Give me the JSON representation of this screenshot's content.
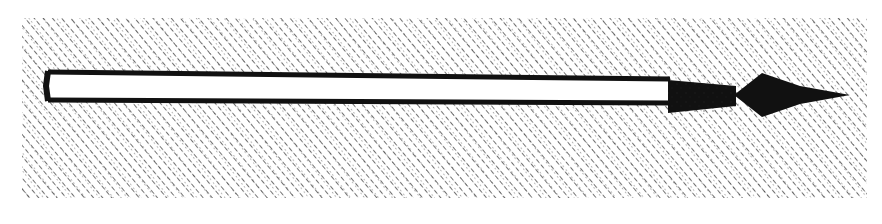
{
  "image": {
    "subject": "engraved illustration of a spear with diamond-shaped head on cross-hatched background",
    "background_color": "#ffffff",
    "ink_color": "#111111",
    "hatch_region": {
      "x": 22,
      "y": 18,
      "width": 845,
      "height": 180
    },
    "spear": {
      "shaft": {
        "x1": 45,
        "x2": 670,
        "top": 72,
        "bottom": 102
      },
      "socket": {
        "x1": 668,
        "x2": 736,
        "top": 83,
        "bottom": 113
      },
      "head": {
        "x1": 735,
        "x2": 850,
        "peak_x": 762,
        "top": 73,
        "bottom": 117,
        "center_y": 95
      }
    }
  }
}
